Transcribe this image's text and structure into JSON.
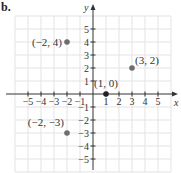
{
  "part_label": "b.",
  "chart_data": {
    "type": "scatter",
    "title": "",
    "xlabel": "x",
    "ylabel": "y",
    "xlim": [
      -6,
      6
    ],
    "ylim": [
      -6,
      6
    ],
    "grid": true,
    "x_ticks": [
      -5,
      -4,
      -3,
      -2,
      -1,
      1,
      2,
      3,
      4,
      5
    ],
    "y_ticks": [
      5,
      4,
      3,
      2,
      1,
      -1,
      -2,
      -3,
      -4,
      -5
    ],
    "x_tick_labels": [
      "−5",
      "−4",
      "−3",
      "−2",
      "−1",
      "1",
      "2",
      "3",
      "4",
      "5"
    ],
    "y_tick_labels": [
      "5",
      "4",
      "3",
      "2",
      "1",
      "−1",
      "−2",
      "−3",
      "−4",
      "−5"
    ],
    "series": [
      {
        "name": "points",
        "points": [
          {
            "x": -2,
            "y": 4,
            "label": "(−2, 4)",
            "color": "#6e6e6e"
          },
          {
            "x": 3,
            "y": 2,
            "label": "(3, 2)",
            "color": "#6e6e6e"
          },
          {
            "x": 1,
            "y": 0,
            "label": "(1, 0)",
            "color": "#222222"
          },
          {
            "x": -2,
            "y": -3,
            "label": "(−2, −3)",
            "color": "#6e6e6e"
          }
        ]
      }
    ]
  },
  "colors": {
    "axis": "#333333",
    "grid": "#e3e3e3",
    "point": "#6e6e6e",
    "origin_point": "#222222"
  }
}
